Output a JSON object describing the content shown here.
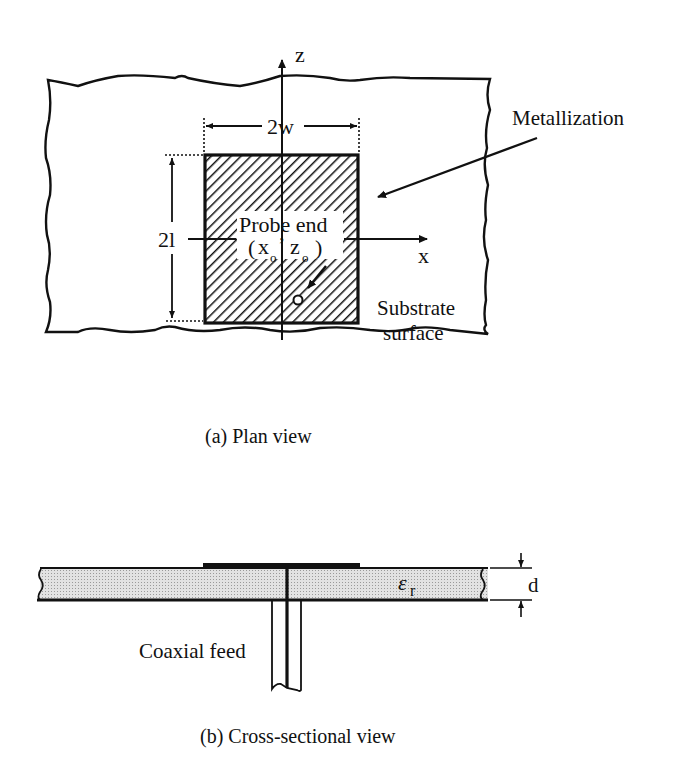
{
  "plan_view": {
    "axis_z_label": "z",
    "axis_x_label": "x",
    "width_label": "2w",
    "length_label": "2l",
    "metallization_label": "Metallization",
    "probe_label_line1": "Probe end",
    "probe_label_x": "x",
    "probe_label_z": "z",
    "probe_sub": "o",
    "probe_marker": "o",
    "substrate_label_line1": "Substrate",
    "substrate_label_line2": "surface",
    "caption": "(a)  Plan view"
  },
  "cross_section": {
    "permittivity_label": "ε",
    "permittivity_sub": "r",
    "thickness_label": "d",
    "feed_label": "Coaxial feed",
    "caption": "(b)  Cross-sectional view"
  },
  "colors": {
    "ink": "#111111",
    "substrate_fill": "#d6d6d6",
    "background": "#ffffff"
  }
}
